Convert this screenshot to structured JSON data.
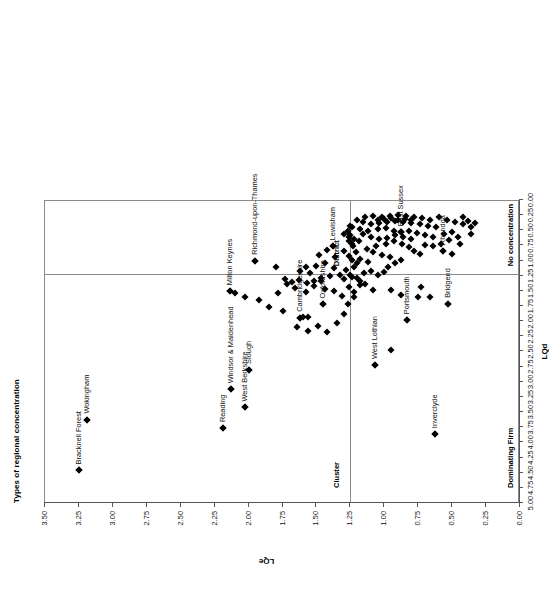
{
  "chart_data": {
    "type": "scatter",
    "title": "Types of regional concentration",
    "xlabel": "LQd",
    "ylabel": "LQe",
    "xlim": [
      0.0,
      3.5
    ],
    "ylim": [
      0.0,
      5.0
    ],
    "xticks": [
      "0.00",
      "0.25",
      "0.50",
      "0.75",
      "1.00",
      "1.25",
      "1.50",
      "1.75",
      "2.00",
      "2.25",
      "2.50",
      "2.75",
      "3.00",
      "3.25",
      "3.50"
    ],
    "yticks": [
      "0.00",
      "0.25",
      "0.50",
      "0.75",
      "1.00",
      "1.25",
      "1.50",
      "1.75",
      "2.00",
      "2.25",
      "2.50",
      "2.75",
      "3.00",
      "3.25",
      "3.50",
      "3.75",
      "4.00",
      "4.25",
      "4.50",
      "4.75",
      "5.00"
    ],
    "grid": false,
    "legend": "none",
    "reference_lines": {
      "x": 1.25,
      "y": 1.25
    },
    "quadrant_labels": [
      {
        "text": "Dominating Firm",
        "x": 0.06,
        "y": 4.82
      },
      {
        "text": "Cluster",
        "x": 1.34,
        "y": 4.82
      },
      {
        "text": "No concentration",
        "x": 0.06,
        "y": 1.16
      },
      {
        "text": "District",
        "x": 1.34,
        "y": 1.16
      }
    ],
    "annotated_points": [
      {
        "label": "Bracknell Forest",
        "x": 3.25,
        "y": 4.48
      },
      {
        "label": "Wokingham",
        "x": 3.19,
        "y": 3.64
      },
      {
        "label": "Reading",
        "x": 2.19,
        "y": 3.78
      },
      {
        "label": "West Berkshire",
        "x": 2.03,
        "y": 3.44
      },
      {
        "label": "Windsor & Maidenhead",
        "x": 2.13,
        "y": 3.14
      },
      {
        "label": "Slough",
        "x": 2.0,
        "y": 2.82
      },
      {
        "label": "Milton Keynes",
        "x": 2.14,
        "y": 1.52
      },
      {
        "label": "Cambridgeshire",
        "x": 1.62,
        "y": 1.96
      },
      {
        "label": "Oxfordshire",
        "x": 1.45,
        "y": 1.74
      },
      {
        "label": "Richmond-upon-Thames",
        "x": 1.95,
        "y": 1.02
      },
      {
        "label": "Lewisham",
        "x": 1.38,
        "y": 0.78
      },
      {
        "label": "Inverclyde",
        "x": 0.63,
        "y": 3.88
      },
      {
        "label": "West Lothian",
        "x": 1.07,
        "y": 2.74
      },
      {
        "label": "Portsmouth",
        "x": 0.83,
        "y": 2.0
      },
      {
        "label": "Bridgend",
        "x": 0.53,
        "y": 1.73
      },
      {
        "label": "East Sussex",
        "x": 0.88,
        "y": 0.55
      },
      {
        "label": "Rhondda",
        "x": 0.57,
        "y": 0.86
      }
    ],
    "points": [
      [
        3.25,
        4.48
      ],
      [
        3.19,
        3.64
      ],
      [
        2.19,
        3.78
      ],
      [
        2.03,
        3.44
      ],
      [
        2.13,
        3.14
      ],
      [
        2.0,
        2.82
      ],
      [
        1.62,
        1.96
      ],
      [
        1.6,
        1.95
      ],
      [
        1.56,
        1.94
      ],
      [
        1.45,
        1.74
      ],
      [
        1.75,
        1.84
      ],
      [
        1.85,
        1.78
      ],
      [
        1.92,
        1.66
      ],
      [
        2.03,
        1.62
      ],
      [
        2.1,
        1.55
      ],
      [
        2.14,
        1.52
      ],
      [
        1.64,
        2.12
      ],
      [
        1.56,
        2.18
      ],
      [
        1.49,
        2.09
      ],
      [
        1.42,
        2.2
      ],
      [
        1.35,
        2.05
      ],
      [
        1.3,
        1.9
      ],
      [
        1.27,
        1.73
      ],
      [
        1.31,
        1.6
      ],
      [
        1.37,
        1.52
      ],
      [
        1.44,
        1.48
      ],
      [
        1.52,
        1.44
      ],
      [
        1.58,
        1.53
      ],
      [
        1.66,
        1.47
      ],
      [
        1.72,
        1.41
      ],
      [
        1.78,
        1.55
      ],
      [
        1.3,
        1.32
      ],
      [
        1.24,
        1.28
      ],
      [
        1.33,
        1.26
      ],
      [
        1.4,
        1.27
      ],
      [
        1.47,
        1.3
      ],
      [
        1.55,
        1.22
      ],
      [
        1.62,
        1.18
      ],
      [
        1.58,
        1.12
      ],
      [
        1.5,
        1.1
      ],
      [
        1.44,
        1.06
      ],
      [
        1.37,
        1.14
      ],
      [
        1.28,
        1.17
      ],
      [
        1.22,
        1.12
      ],
      [
        1.47,
        1.36
      ],
      [
        1.52,
        1.35
      ],
      [
        1.57,
        1.38
      ],
      [
        1.63,
        1.33
      ],
      [
        1.68,
        1.37
      ],
      [
        1.73,
        1.32
      ],
      [
        1.95,
        1.02
      ],
      [
        1.8,
        1.12
      ],
      [
        1.38,
        0.78
      ],
      [
        1.3,
        0.86
      ],
      [
        1.42,
        0.84
      ],
      [
        1.48,
        0.92
      ],
      [
        1.36,
        0.96
      ],
      [
        1.26,
        0.94
      ],
      [
        1.18,
        0.99
      ],
      [
        1.12,
        1.04
      ],
      [
        1.07,
        2.74
      ],
      [
        0.95,
        2.5
      ],
      [
        0.63,
        3.88
      ],
      [
        0.83,
        2.0
      ],
      [
        0.53,
        1.73
      ],
      [
        0.66,
        1.62
      ],
      [
        0.75,
        1.62
      ],
      [
        0.73,
        1.45
      ],
      [
        0.88,
        1.58
      ],
      [
        0.95,
        1.5
      ],
      [
        1.08,
        1.5
      ],
      [
        1.14,
        1.4
      ],
      [
        1.18,
        1.42
      ],
      [
        1.22,
        1.54
      ],
      [
        1.2,
        1.3
      ],
      [
        1.15,
        1.22
      ],
      [
        1.1,
        1.18
      ],
      [
        1.05,
        1.25
      ],
      [
        1.0,
        1.2
      ],
      [
        0.97,
        1.12
      ],
      [
        0.92,
        1.05
      ],
      [
        0.88,
        1.0
      ],
      [
        0.96,
        0.96
      ],
      [
        1.02,
        0.92
      ],
      [
        1.08,
        0.88
      ],
      [
        1.13,
        0.82
      ],
      [
        1.06,
        0.78
      ],
      [
        0.99,
        0.74
      ],
      [
        0.93,
        0.7
      ],
      [
        0.87,
        0.74
      ],
      [
        0.82,
        0.8
      ],
      [
        0.78,
        0.86
      ],
      [
        0.74,
        0.9
      ],
      [
        0.8,
        0.66
      ],
      [
        0.86,
        0.62
      ],
      [
        0.92,
        0.6
      ],
      [
        0.98,
        0.64
      ],
      [
        1.04,
        0.66
      ],
      [
        1.1,
        0.62
      ],
      [
        1.16,
        0.58
      ],
      [
        1.12,
        0.52
      ],
      [
        1.05,
        0.5
      ],
      [
        0.99,
        0.48
      ],
      [
        0.93,
        0.52
      ],
      [
        0.88,
        0.55
      ],
      [
        0.82,
        0.52
      ],
      [
        0.76,
        0.56
      ],
      [
        0.7,
        0.6
      ],
      [
        0.64,
        0.62
      ],
      [
        0.57,
        0.86
      ],
      [
        0.52,
        0.68
      ],
      [
        0.46,
        0.62
      ],
      [
        0.62,
        0.46
      ],
      [
        0.68,
        0.44
      ],
      [
        0.74,
        0.42
      ],
      [
        0.8,
        0.4
      ],
      [
        0.86,
        0.38
      ],
      [
        0.92,
        0.36
      ],
      [
        0.98,
        0.38
      ],
      [
        1.04,
        0.4
      ],
      [
        1.1,
        0.42
      ],
      [
        1.16,
        0.38
      ],
      [
        1.2,
        0.34
      ],
      [
        1.14,
        0.3
      ],
      [
        1.08,
        0.28
      ],
      [
        1.02,
        0.3
      ],
      [
        0.96,
        0.28
      ],
      [
        0.9,
        0.26
      ],
      [
        0.84,
        0.28
      ],
      [
        0.78,
        0.3
      ],
      [
        0.72,
        0.32
      ],
      [
        0.66,
        0.34
      ],
      [
        0.6,
        0.3
      ],
      [
        0.54,
        0.34
      ],
      [
        0.48,
        0.38
      ],
      [
        0.42,
        0.42
      ],
      [
        0.36,
        0.46
      ],
      [
        0.58,
        0.74
      ],
      [
        0.64,
        0.78
      ],
      [
        0.7,
        0.76
      ],
      [
        0.44,
        0.75
      ],
      [
        0.5,
        0.55
      ],
      [
        0.56,
        0.58
      ],
      [
        0.36,
        0.58
      ],
      [
        1.19,
        0.7
      ],
      [
        1.24,
        0.74
      ],
      [
        1.22,
        0.66
      ],
      [
        1.26,
        0.62
      ],
      [
        1.3,
        0.58
      ],
      [
        1.18,
        0.5
      ],
      [
        1.24,
        0.46
      ],
      [
        0.88,
        0.55
      ],
      [
        1.22,
        1.62
      ],
      [
        1.26,
        1.46
      ],
      [
        1.18,
        1.35
      ],
      [
        1.25,
        1.25
      ],
      [
        1.2,
        1.05
      ],
      [
        1.24,
        1.0
      ],
      [
        1.21,
        0.88
      ],
      [
        1.23,
        0.78
      ],
      [
        1.26,
        0.7
      ],
      [
        1.25,
        0.6
      ],
      [
        1.27,
        0.52
      ],
      [
        1.25,
        0.44
      ],
      [
        0.5,
        0.9
      ],
      [
        0.42,
        0.3
      ],
      [
        0.38,
        0.36
      ],
      [
        0.33,
        0.4
      ],
      [
        1.05,
        0.35
      ],
      [
        1.0,
        0.33
      ],
      [
        0.95,
        0.32
      ],
      [
        0.9,
        0.34
      ],
      [
        0.85,
        0.33
      ],
      [
        0.8,
        0.35
      ]
    ]
  }
}
